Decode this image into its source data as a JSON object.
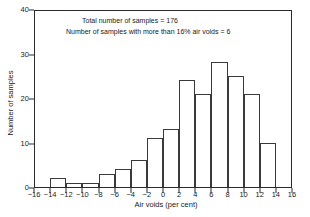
{
  "chart_data": {
    "type": "bar",
    "title": "",
    "subtitle": "",
    "xlabel": "Air voids (per cent)",
    "ylabel": "Number of samples",
    "xlim": [
      -16,
      16
    ],
    "ylim": [
      0,
      40
    ],
    "grid": false,
    "legend": null,
    "bin_width": 2,
    "bin_edges": [
      -14,
      -12,
      -10,
      -8,
      -6,
      -4,
      -2,
      0,
      2,
      4,
      6,
      8,
      10,
      12,
      14
    ],
    "categories": [
      "-14 to -12",
      "-12 to -10",
      "-10 to -8",
      "-8 to -6",
      "-6 to -4",
      "-4 to -2",
      "-2 to 0",
      "0 to 2",
      "2 to 4",
      "4 to 6",
      "6 to 8",
      "8 to 10",
      "10 to 12",
      "12 to 14"
    ],
    "values": [
      2,
      1,
      1,
      3,
      4,
      6,
      11,
      13,
      24,
      21,
      28,
      25,
      21,
      10
    ],
    "xticks": [
      -16,
      -14,
      -12,
      -10,
      -8,
      -6,
      -4,
      -2,
      0,
      2,
      4,
      6,
      8,
      10,
      12,
      14,
      16
    ],
    "xticklabels": [
      "−16",
      "−14",
      "−12",
      "−10",
      "−8",
      "−6",
      "−4",
      "−2",
      "0",
      "2",
      "4",
      "6",
      "8",
      "10",
      "12",
      "14",
      "16"
    ],
    "yticks": [
      0,
      10,
      20,
      30,
      40
    ],
    "yticklabels": [
      "0",
      "10",
      "20",
      "30",
      "40"
    ],
    "annotations": [
      "Total number of samples = 176",
      "Number of samples with more than 16% air voids = 6"
    ],
    "colors": {
      "bar_edge": "#3a3a3a",
      "bar_fill": "transparent",
      "axis": "#2b2b2b",
      "text": "#1a1a1a",
      "background": "#ffffff"
    }
  }
}
